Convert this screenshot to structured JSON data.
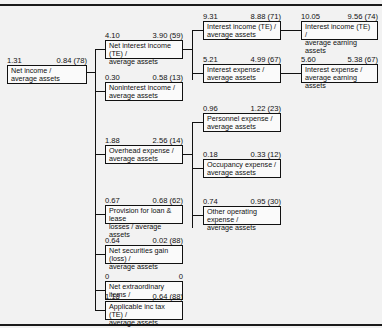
{
  "diagram": {
    "root": {
      "left_value": "1.31",
      "right_value": "0.84 (78)",
      "label_line1": "Net income /",
      "label_line2": "average assets"
    },
    "level1": [
      {
        "left_value": "4.10",
        "right_value": "3.90 (59)",
        "label_line1": "Net interest income (TE) /",
        "label_line2": "average assets"
      },
      {
        "left_value": "0.30",
        "right_value": "0.58 (13)",
        "label_line1": "Noninterest income /",
        "label_line2": "average assets"
      },
      {
        "left_value": "1.88",
        "right_value": "2.56 (14)",
        "label_line1": "Overhead expense /",
        "label_line2": "average assets"
      },
      {
        "left_value": "0.67",
        "right_value": "0.68 (62)",
        "label_line1": "Provision for loan & lease",
        "label_line2": "losses / average assets"
      },
      {
        "left_value": "0.64",
        "right_value": "0.02 (88)",
        "label_line1": "Net securities gain (loss) /",
        "label_line2": "average assets"
      },
      {
        "left_value": "0",
        "right_value": "0",
        "label_line1": "Net extraordinary items /",
        "label_line2": "average assets"
      },
      {
        "left_value": "1.18",
        "right_value": "0.64 (88)",
        "label_line1": "Applicable inc tax (TE) /",
        "label_line2": "average assets"
      }
    ],
    "level2": [
      {
        "left_value": "9.31",
        "right_value": "8.88 (71)",
        "label_line1": "Interest income (TE) /",
        "label_line2": "average assets"
      },
      {
        "left_value": "5.21",
        "right_value": "4.99 (67)",
        "label_line1": "Interest expense /",
        "label_line2": "average assets"
      },
      {
        "left_value": "0.96",
        "right_value": "1.22 (23)",
        "label_line1": "Personnel expense /",
        "label_line2": "average assets"
      },
      {
        "left_value": "0.18",
        "right_value": "0.33 (12)",
        "label_line1": "Occupancy expense /",
        "label_line2": "average assets"
      },
      {
        "left_value": "0.74",
        "right_value": "0.95 (30)",
        "label_line1": "Other operating expense /",
        "label_line2": "average assets"
      }
    ],
    "level3": [
      {
        "left_value": "10.05",
        "right_value": "9.56 (74)",
        "label_line1": "Interest income (TE) /",
        "label_line2": "average earning assets"
      },
      {
        "left_value": "5.60",
        "right_value": "5.38 (67)",
        "label_line1": "Interest expense /",
        "label_line2": "average earning assets"
      }
    ]
  }
}
